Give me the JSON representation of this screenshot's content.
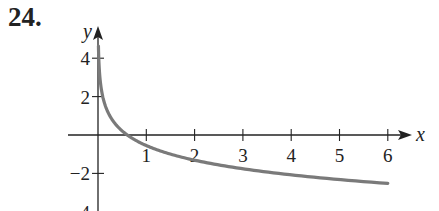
{
  "problem_number": "24.",
  "chart_data": {
    "type": "line",
    "title": "",
    "xlabel": "x",
    "ylabel": "y",
    "xlim": [
      0,
      6.5
    ],
    "ylim": [
      -4,
      4.7
    ],
    "x_ticks": [
      1,
      2,
      3,
      4,
      5,
      6
    ],
    "y_ticks": [
      4,
      2,
      -2,
      -4
    ],
    "x_tick_labels": [
      "1",
      "2",
      "3",
      "4",
      "5",
      "6"
    ],
    "y_tick_labels": [
      "4",
      "2",
      "−2",
      "−4"
    ],
    "grid": false,
    "legend": null,
    "series": [
      {
        "name": "curve",
        "color": "#7a7a7a",
        "x": [
          0.009,
          0.05,
          0.1,
          0.2,
          0.3,
          0.5,
          0.6,
          1,
          1.5,
          2,
          3,
          4,
          5,
          6
        ],
        "y": [
          4.65,
          2.75,
          2.0,
          1.22,
          0.77,
          0.21,
          0.0,
          -0.55,
          -1.0,
          -1.31,
          -1.76,
          -2.07,
          -2.32,
          -2.52
        ]
      }
    ]
  }
}
